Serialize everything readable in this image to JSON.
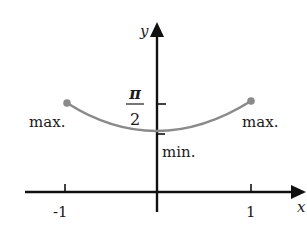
{
  "diagram": {
    "type": "function-graph",
    "axes": {
      "x_label": "x",
      "y_label": "y",
      "x_ticks": [
        {
          "value": -1,
          "label": "-1"
        },
        {
          "value": 1,
          "label": "1"
        }
      ],
      "y_ticks": [
        {
          "value": "pi/2",
          "label_numerator": "π",
          "label_denominator": "2"
        }
      ]
    },
    "curve": {
      "color": "#8a8a8a",
      "endpoints_marked": true
    },
    "annotations": {
      "left_max": "max.",
      "right_max": "max.",
      "min": "min."
    },
    "colors": {
      "axis": "#111111",
      "curve": "#8a8a8a",
      "text": "#1a1a1a"
    }
  }
}
